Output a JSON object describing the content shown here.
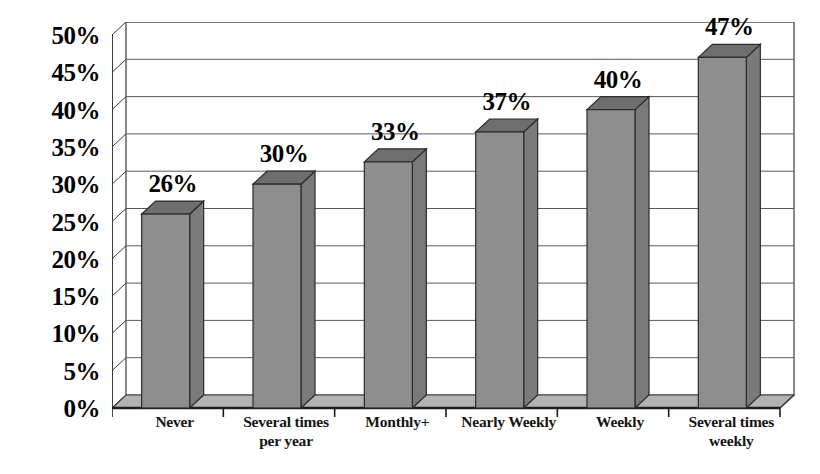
{
  "chart_data": {
    "type": "bar",
    "title": "",
    "subtitle": "",
    "xlabel": "",
    "ylabel": "",
    "categories": [
      "Never",
      "Several times per year",
      "Monthly+",
      "Nearly Weekly",
      "Weekly",
      "Several times weekly"
    ],
    "category_lines": [
      [
        "Never"
      ],
      [
        "Several times",
        "per year"
      ],
      [
        "Monthly+"
      ],
      [
        "Nearly Weekly"
      ],
      [
        "Weekly"
      ],
      [
        "Several times",
        "weekly"
      ]
    ],
    "values": [
      26,
      30,
      33,
      37,
      40,
      47
    ],
    "data_labels": [
      "26%",
      "30%",
      "33%",
      "37%",
      "40%",
      "47%"
    ],
    "ylim": [
      0,
      50
    ],
    "ytick_values": [
      50,
      45,
      40,
      35,
      30,
      25,
      20,
      15,
      10,
      5,
      0
    ],
    "ytick_labels": [
      "50%",
      "45%",
      "40%",
      "35%",
      "30%",
      "25%",
      "20%",
      "15%",
      "10%",
      "5%",
      "0%"
    ],
    "grid": true,
    "grid_axis": "y",
    "legend": false,
    "legend_position": "none",
    "three_d": true,
    "units": "percent"
  },
  "style": {
    "bar_front_color": "#8e8e8e",
    "bar_top_color": "#6e6e6e",
    "bar_side_color": "#7a7a7a",
    "bar_outline_color": "#2b2b2b",
    "floor_color": "#b3b3b3",
    "wall_color": "#ffffff",
    "axis_color": "#3c3c3c",
    "grid_color": "#5a5a5a",
    "text_color": "#000000",
    "background_color": "#ffffff"
  }
}
